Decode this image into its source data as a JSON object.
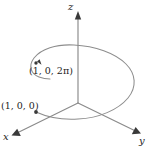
{
  "figure": {
    "kind": "3d-helix-diagram",
    "background_color": "#ffffff",
    "axis_color": "#8a8a8a",
    "curve_color": "#8d8d8d",
    "text_color": "#1c1c1c",
    "origin": {
      "x": 78,
      "y": 103
    }
  },
  "axes": [
    {
      "id": "z",
      "label": "z",
      "direction": "up",
      "from": {
        "x": 78,
        "y": 103
      },
      "to": {
        "x": 78,
        "y": 14
      }
    },
    {
      "id": "y",
      "label": "y",
      "direction": "lower-right",
      "from": {
        "x": 78,
        "y": 103
      },
      "to": {
        "x": 140,
        "y": 133
      }
    },
    {
      "id": "x",
      "label": "x",
      "direction": "lower-left",
      "from": {
        "x": 78,
        "y": 103
      },
      "to": {
        "x": 13,
        "y": 135
      }
    }
  ],
  "points": [
    {
      "id": "top-point",
      "label": "(1, 0, 2π)",
      "marker": {
        "x": 36,
        "y": 63
      },
      "description": "end of helix, one full turn above start"
    },
    {
      "id": "bottom-point",
      "label": "(1, 0, 0)",
      "marker": {
        "x": 36,
        "y": 112
      },
      "description": "start of helix on the x-axis"
    }
  ],
  "curve": {
    "id": "helix",
    "name": "helix-curve",
    "turns": 1,
    "start_point_id": "bottom-point",
    "end_point_id": "top-point",
    "path": "M 36,112 C 52,119 74,121 95,117 C 116,113 131,102 132,89 C 133,75 120,63 100,58 C 80,53 58,56 45,65 C 33,73 34,84 44,90 C 49,93 55,95 60,96"
  }
}
